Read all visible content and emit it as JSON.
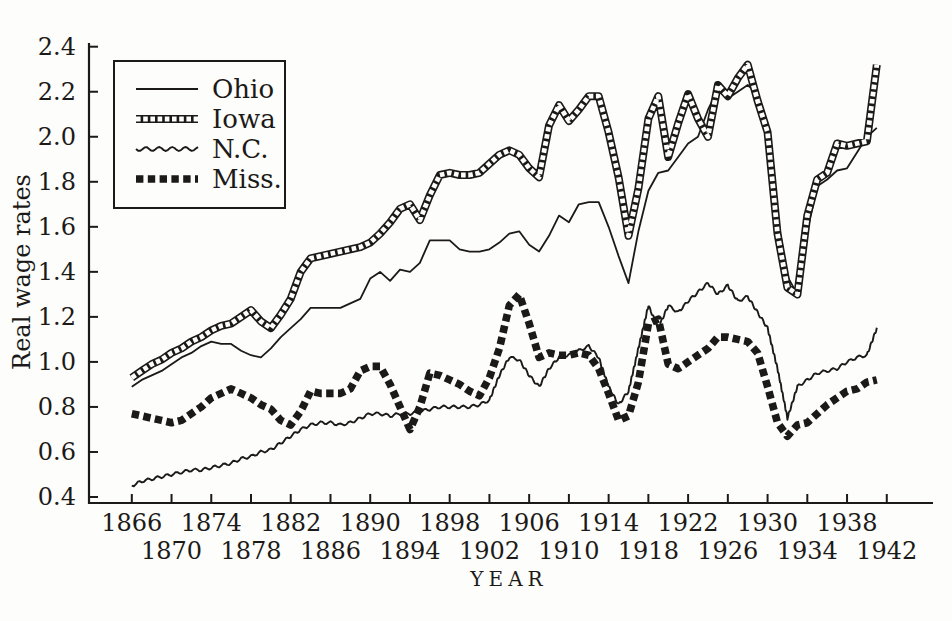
{
  "figure": {
    "background": "#fdfdfb",
    "ink": "#1c1a18"
  },
  "chart_data": {
    "type": "line",
    "title": "",
    "xlabel": "YEAR",
    "ylabel": "Real wage rates",
    "x_range": [
      1866,
      1942
    ],
    "y_range": [
      0.4,
      2.4
    ],
    "x_tick_step": 4,
    "grid": false,
    "legend_position": "top-left",
    "y_ticks": [
      "2.4",
      "2.2",
      "2.0",
      "1.8",
      "1.6",
      "1.4",
      "1.2",
      "1.0",
      "0.8",
      "0.6",
      "0.4"
    ],
    "x_ticks_upper": [
      "1866",
      "1874",
      "1882",
      "1890",
      "1898",
      "1906",
      "1914",
      "1922",
      "1930",
      "1938"
    ],
    "x_ticks_lower": [
      "1870",
      "1878",
      "1886",
      "1894",
      "1902",
      "1910",
      "1918",
      "1926",
      "1934",
      "1942"
    ],
    "x": [
      1866,
      1867,
      1868,
      1869,
      1870,
      1871,
      1872,
      1873,
      1874,
      1875,
      1876,
      1877,
      1878,
      1879,
      1880,
      1881,
      1882,
      1883,
      1884,
      1885,
      1886,
      1887,
      1888,
      1889,
      1890,
      1891,
      1892,
      1893,
      1894,
      1895,
      1896,
      1897,
      1898,
      1899,
      1900,
      1901,
      1902,
      1903,
      1904,
      1905,
      1906,
      1907,
      1908,
      1909,
      1910,
      1911,
      1912,
      1913,
      1914,
      1915,
      1916,
      1917,
      1918,
      1919,
      1920,
      1921,
      1922,
      1923,
      1924,
      1925,
      1926,
      1927,
      1928,
      1929,
      1930,
      1931,
      1932,
      1933,
      1934,
      1935,
      1936,
      1937,
      1938,
      1939,
      1940,
      1941
    ],
    "series": [
      {
        "name": "Ohio",
        "style": "solid-thin",
        "values": [
          0.89,
          0.92,
          0.94,
          0.96,
          0.99,
          1.02,
          1.04,
          1.07,
          1.09,
          1.08,
          1.08,
          1.05,
          1.03,
          1.02,
          1.06,
          1.11,
          1.15,
          1.19,
          1.24,
          1.24,
          1.24,
          1.24,
          1.26,
          1.28,
          1.37,
          1.4,
          1.36,
          1.41,
          1.4,
          1.44,
          1.54,
          1.54,
          1.54,
          1.5,
          1.49,
          1.49,
          1.5,
          1.53,
          1.57,
          1.58,
          1.52,
          1.49,
          1.56,
          1.65,
          1.62,
          1.7,
          1.71,
          1.71,
          1.6,
          1.47,
          1.35,
          1.58,
          1.76,
          1.84,
          1.85,
          1.91,
          1.97,
          2.0,
          2.12,
          2.21,
          2.17,
          2.2,
          2.23,
          2.19,
          2.0,
          1.65,
          1.38,
          1.3,
          1.58,
          1.78,
          1.81,
          1.85,
          1.86,
          1.93,
          2.0,
          2.04
        ]
      },
      {
        "name": "Iowa",
        "style": "hollow-squares",
        "values": [
          0.93,
          0.96,
          0.99,
          1.01,
          1.04,
          1.06,
          1.09,
          1.11,
          1.14,
          1.16,
          1.17,
          1.2,
          1.23,
          1.18,
          1.15,
          1.21,
          1.28,
          1.4,
          1.46,
          1.47,
          1.48,
          1.49,
          1.5,
          1.51,
          1.53,
          1.57,
          1.62,
          1.68,
          1.7,
          1.63,
          1.74,
          1.83,
          1.84,
          1.83,
          1.83,
          1.84,
          1.88,
          1.92,
          1.94,
          1.92,
          1.86,
          1.82,
          2.05,
          2.14,
          2.07,
          2.12,
          2.18,
          2.18,
          2.02,
          1.82,
          1.56,
          1.77,
          2.08,
          2.18,
          1.91,
          2.06,
          2.19,
          2.08,
          2.0,
          2.23,
          2.18,
          2.26,
          2.32,
          2.16,
          2.02,
          1.57,
          1.33,
          1.3,
          1.65,
          1.81,
          1.84,
          1.97,
          1.96,
          1.97,
          1.98,
          2.32
        ]
      },
      {
        "name": "N.C.",
        "style": "wavy-thin",
        "values": [
          0.45,
          0.47,
          0.48,
          0.49,
          0.5,
          0.51,
          0.52,
          0.52,
          0.53,
          0.54,
          0.55,
          0.57,
          0.58,
          0.6,
          0.61,
          0.64,
          0.67,
          0.7,
          0.72,
          0.73,
          0.73,
          0.72,
          0.73,
          0.75,
          0.77,
          0.77,
          0.76,
          0.77,
          0.77,
          0.78,
          0.79,
          0.8,
          0.8,
          0.8,
          0.8,
          0.81,
          0.83,
          0.94,
          1.02,
          1.01,
          0.94,
          0.89,
          0.97,
          1.02,
          1.03,
          1.05,
          1.07,
          1.02,
          0.89,
          0.81,
          0.87,
          1.06,
          1.25,
          1.15,
          1.25,
          1.22,
          1.27,
          1.31,
          1.35,
          1.3,
          1.34,
          1.27,
          1.29,
          1.22,
          1.15,
          0.97,
          0.75,
          0.89,
          0.92,
          0.95,
          0.96,
          0.97,
          1.0,
          1.02,
          1.03,
          1.15
        ]
      },
      {
        "name": "Miss.",
        "style": "dashed-thick",
        "values": [
          0.77,
          0.76,
          0.75,
          0.74,
          0.73,
          0.74,
          0.77,
          0.8,
          0.84,
          0.86,
          0.88,
          0.86,
          0.84,
          0.81,
          0.79,
          0.74,
          0.72,
          0.78,
          0.87,
          0.86,
          0.86,
          0.86,
          0.88,
          0.96,
          0.98,
          0.98,
          0.9,
          0.8,
          0.7,
          0.8,
          0.95,
          0.94,
          0.92,
          0.9,
          0.87,
          0.85,
          0.93,
          1.06,
          1.25,
          1.3,
          1.17,
          1.02,
          1.04,
          1.03,
          1.03,
          1.04,
          1.03,
          0.97,
          0.86,
          0.74,
          0.76,
          0.91,
          1.17,
          1.19,
          0.99,
          0.97,
          1.0,
          1.03,
          1.06,
          1.11,
          1.11,
          1.1,
          1.09,
          1.04,
          0.89,
          0.73,
          0.67,
          0.72,
          0.73,
          0.77,
          0.81,
          0.84,
          0.87,
          0.88,
          0.91,
          0.92
        ]
      }
    ]
  }
}
